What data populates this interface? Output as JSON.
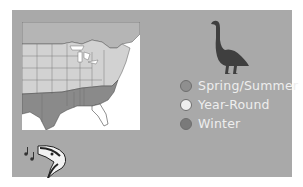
{
  "card": {
    "background": "#a9a9a9"
  },
  "map": {
    "region": "Eastern United States range map"
  },
  "icon": {
    "bird": "goose-silhouette-icon",
    "song": "bird-song-icon"
  },
  "legend": {
    "items": [
      {
        "label": "Spring/Summer",
        "color": "#8f8f8f"
      },
      {
        "label": "Year-Round",
        "color": "#eeeeee"
      },
      {
        "label": "Winter",
        "color": "#7a7a7a"
      }
    ]
  }
}
